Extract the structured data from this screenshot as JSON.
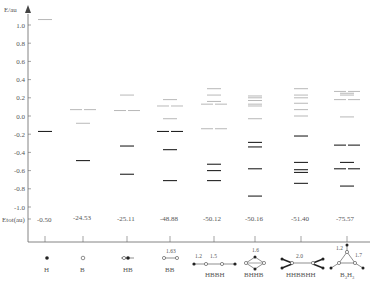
{
  "chart_data": {
    "type": "energy-level-diagram",
    "title": "",
    "ylabel": "E/au",
    "ylim": [
      -1.1,
      1.1
    ],
    "yticks": [
      "1.0",
      "0.8",
      "0.6",
      "0.4",
      "0.2",
      "0.0",
      "-0.2",
      "-0.4",
      "-0.6",
      "-0.8",
      "-1.0"
    ],
    "ytick_values": [
      1.0,
      0.8,
      0.6,
      0.4,
      0.2,
      0.0,
      -0.2,
      -0.4,
      -0.6,
      -0.8,
      -1.0
    ],
    "etot_label": "Etot(au)",
    "grid": false,
    "colors": {
      "occupied": "#222222",
      "virtual": "#999999",
      "axis": "#666666"
    },
    "columns": [
      {
        "name": "H",
        "etot": "-0.50",
        "x": 45,
        "occupied": [
          [
            -0.17,
            1
          ]
        ],
        "virtual": [
          [
            1.06,
            1
          ]
        ]
      },
      {
        "name": "B",
        "etot": "-24.53",
        "x": 83,
        "occupied": [
          [
            -0.49,
            1
          ]
        ],
        "virtual": [
          [
            0.07,
            2
          ],
          [
            -0.08,
            1
          ]
        ]
      },
      {
        "name": "HB",
        "etot": "-25.11",
        "x": 127,
        "occupied": [
          [
            -0.33,
            1
          ],
          [
            -0.64,
            1
          ]
        ],
        "virtual": [
          [
            0.23,
            1
          ],
          [
            0.06,
            2
          ]
        ]
      },
      {
        "name": "BB",
        "etot": "-48.88",
        "x": 170,
        "occupied": [
          [
            -0.17,
            2
          ],
          [
            -0.37,
            1
          ],
          [
            -0.71,
            1
          ]
        ],
        "virtual": [
          [
            0.18,
            1
          ],
          [
            0.11,
            2
          ],
          [
            -0.03,
            1
          ]
        ],
        "bond_labels": [
          "1.63"
        ]
      },
      {
        "name": "HBBH",
        "etot": "-50.12",
        "x": 214,
        "occupied": [
          [
            -0.53,
            1
          ],
          [
            -0.6,
            1
          ],
          [
            -0.71,
            1
          ]
        ],
        "virtual": [
          [
            0.3,
            1
          ],
          [
            0.23,
            1
          ],
          [
            0.16,
            1
          ],
          [
            0.13,
            2
          ],
          [
            -0.14,
            2
          ]
        ],
        "bond_labels": [
          "1.2",
          "1.5"
        ]
      },
      {
        "name": "BHHB",
        "etot": "-50.16",
        "x": 255,
        "occupied": [
          [
            -0.29,
            1
          ],
          [
            -0.34,
            1
          ],
          [
            -0.58,
            1
          ],
          [
            -0.88,
            1
          ]
        ],
        "virtual": [
          [
            0.22,
            1
          ],
          [
            0.2,
            1
          ],
          [
            0.17,
            1
          ],
          [
            0.13,
            1
          ],
          [
            0.11,
            1
          ],
          [
            -0.03,
            1
          ]
        ],
        "bond_labels": [
          "1.6"
        ]
      },
      {
        "name": "HHBBHH",
        "etot": "-51.40",
        "x": 301,
        "occupied": [
          [
            -0.22,
            1
          ],
          [
            -0.51,
            1
          ],
          [
            -0.59,
            1
          ],
          [
            -0.62,
            1
          ],
          [
            -0.74,
            1
          ]
        ],
        "virtual": [
          [
            0.3,
            1
          ],
          [
            0.23,
            1
          ],
          [
            0.2,
            1
          ],
          [
            0.14,
            1
          ],
          [
            0.07,
            1
          ],
          [
            0.0,
            1
          ]
        ],
        "bond_labels": [
          "2.0"
        ]
      },
      {
        "name": "B3H3",
        "etot": "-75.57",
        "x": 347,
        "occupied": [
          [
            -0.32,
            2
          ],
          [
            -0.51,
            1
          ],
          [
            -0.58,
            2
          ],
          [
            -0.77,
            1
          ]
        ],
        "virtual": [
          [
            0.27,
            2
          ],
          [
            0.25,
            1
          ],
          [
            0.23,
            1
          ],
          [
            0.18,
            2
          ],
          [
            -0.01,
            1
          ]
        ],
        "bond_labels": [
          "1.2",
          "1.7"
        ]
      }
    ]
  },
  "axis": {
    "ylabel": "E/au",
    "etot_label": "Etot(au)"
  },
  "molecules": {
    "m0": {
      "name": "H",
      "etot": "-0.50"
    },
    "m1": {
      "name": "B",
      "etot": "-24.53"
    },
    "m2": {
      "name": "HB",
      "etot": "-25.11"
    },
    "m3": {
      "name": "BB",
      "etot": "-48.88",
      "bond": "1.63"
    },
    "m4": {
      "name": "HBBH",
      "etot": "-50.12",
      "bond1": "1.2",
      "bond2": "1.5"
    },
    "m5": {
      "name": "BHHB",
      "etot": "-50.16",
      "bond": "1.6"
    },
    "m6": {
      "name": "HHBBHH",
      "etot": "-51.40",
      "bond": "2.0"
    },
    "m7": {
      "name": "B3H3",
      "name_main": "B",
      "name_sub1": "3",
      "name_mid": "H",
      "name_sub2": "3",
      "etot": "-75.57",
      "bond1": "1.2",
      "bond2": "1.7"
    }
  }
}
